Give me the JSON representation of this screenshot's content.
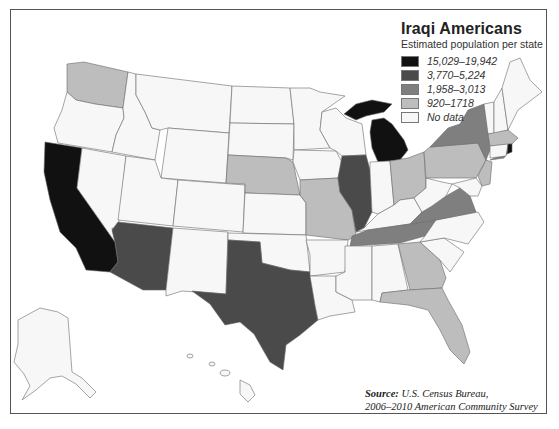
{
  "legend": {
    "title": "Iraqi Americans",
    "subtitle": "Estimated population per state",
    "items": [
      {
        "label": "15,029–19,942",
        "color": "#111111"
      },
      {
        "label": "3,770–5,224",
        "color": "#4a4a4a"
      },
      {
        "label": "1,958–3,013",
        "color": "#7f7f7f"
      },
      {
        "label": "920–1718",
        "color": "#bdbdbd"
      },
      {
        "label": "No data",
        "color": "#f7f7f7"
      }
    ]
  },
  "source": {
    "label": "Source:",
    "line1": "U.S. Census Bureau,",
    "line2": "2006–2010 American Community Survey"
  },
  "map_data": {
    "type": "choropleth",
    "title": "Iraqi Americans",
    "states": {
      "California": "15,029–19,942",
      "Michigan": "15,029–19,942",
      "Arizona": "3,770–5,224",
      "Texas": "3,770–5,224",
      "Illinois": "3,770–5,224",
      "New York": "1,958–3,013",
      "Virginia": "1,958–3,013",
      "Tennessee": "1,958–3,013",
      "Washington": "920–1718",
      "Nebraska": "920–1718",
      "Missouri": "920–1718",
      "Ohio": "920–1718",
      "Pennsylvania": "920–1718",
      "Georgia": "920–1718",
      "Florida": "920–1718",
      "Massachusetts": "920–1718",
      "New Jersey": "920–1718"
    }
  }
}
